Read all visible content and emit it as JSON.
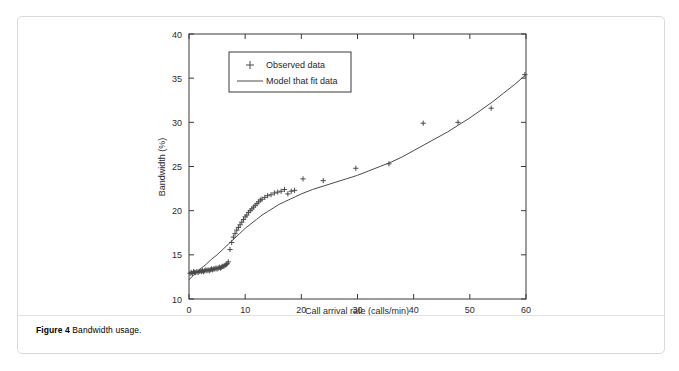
{
  "figure": {
    "caption_label": "Figure 4",
    "caption_text": "Bandwidth usage."
  },
  "chart_data": {
    "type": "scatter",
    "title": "",
    "xlabel": "Call arrival rate (calls/min)",
    "ylabel": "Bandwidth (%)",
    "xlim": [
      0,
      60
    ],
    "ylim": [
      10,
      40
    ],
    "xticks": [
      0,
      10,
      20,
      30,
      40,
      50,
      60
    ],
    "yticks": [
      10,
      15,
      20,
      25,
      30,
      35,
      40
    ],
    "xtick_labels": [
      "0",
      "10",
      "20",
      "30",
      "40",
      "50",
      "60"
    ],
    "ytick_labels": [
      "10",
      "15",
      "20",
      "25",
      "30",
      "35",
      "40"
    ],
    "grid": false,
    "legend_position": "upper left",
    "legend": [
      {
        "label": "Observed data",
        "marker": "plus",
        "color": "#4a4a4a"
      },
      {
        "label": "Model that fit data",
        "marker": "line",
        "color": "#4a4a4a"
      }
    ],
    "series": [
      {
        "name": "Observed data",
        "marker": "plus",
        "color": "#4a4a4a",
        "x": [
          0.2,
          0.4,
          0.6,
          0.8,
          1.0,
          1.2,
          1.4,
          1.6,
          1.8,
          2.0,
          2.2,
          2.4,
          2.6,
          2.8,
          3.0,
          3.2,
          3.4,
          3.6,
          3.8,
          4.0,
          4.2,
          4.4,
          4.6,
          4.8,
          5.0,
          5.2,
          5.4,
          5.6,
          5.8,
          6.0,
          6.2,
          6.4,
          6.6,
          6.8,
          7.0,
          7.3,
          7.6,
          7.9,
          8.2,
          8.5,
          8.8,
          9.1,
          9.4,
          9.7,
          10.0,
          10.3,
          10.6,
          10.9,
          11.2,
          11.5,
          11.8,
          12.1,
          12.4,
          12.7,
          13.0,
          13.5,
          14.0,
          14.6,
          15.2,
          15.8,
          16.4,
          17.0,
          17.6,
          18.2,
          18.8,
          20.3,
          23.9,
          29.7,
          35.6,
          41.7,
          47.9,
          53.8,
          59.8
        ],
        "y": [
          12.9,
          13.0,
          12.9,
          13.1,
          13.0,
          13.0,
          13.1,
          13.0,
          13.1,
          13.2,
          13.1,
          13.2,
          13.1,
          13.2,
          13.3,
          13.2,
          13.3,
          13.2,
          13.3,
          13.4,
          13.3,
          13.4,
          13.4,
          13.5,
          13.4,
          13.5,
          13.6,
          13.5,
          13.6,
          13.7,
          13.7,
          13.8,
          13.9,
          14.0,
          14.2,
          15.6,
          16.4,
          17.0,
          17.4,
          17.8,
          18.1,
          18.4,
          18.7,
          19.0,
          19.3,
          19.5,
          19.8,
          20.0,
          20.2,
          20.4,
          20.6,
          20.8,
          21.0,
          21.2,
          21.3,
          21.5,
          21.7,
          21.8,
          22.0,
          22.1,
          22.2,
          22.4,
          21.9,
          22.2,
          22.3,
          23.6,
          23.4,
          24.8,
          25.3,
          29.9,
          30.0,
          31.6,
          35.4
        ]
      },
      {
        "name": "Model that fit data",
        "marker": "line",
        "color": "#4a4a4a",
        "x": [
          0.0,
          1.0,
          2.0,
          3.0,
          4.0,
          5.0,
          6.0,
          7.0,
          8.0,
          9.0,
          10.0,
          11.0,
          12.0,
          13.0,
          14.0,
          15.0,
          16.0,
          17.0,
          18.0,
          19.0,
          20.0,
          22.0,
          24.0,
          26.0,
          28.0,
          30.0,
          32.0,
          34.0,
          36.0,
          38.0,
          40.0,
          42.0,
          44.0,
          46.0,
          48.0,
          50.0,
          52.0,
          54.0,
          56.0,
          58.0,
          60.0
        ],
        "y": [
          12.2,
          12.8,
          13.4,
          13.9,
          14.5,
          15.0,
          15.6,
          16.2,
          16.8,
          17.4,
          18.0,
          18.5,
          19.0,
          19.5,
          19.9,
          20.3,
          20.7,
          21.0,
          21.3,
          21.6,
          21.9,
          22.4,
          22.8,
          23.2,
          23.6,
          24.0,
          24.5,
          25.0,
          25.5,
          26.1,
          26.8,
          27.5,
          28.2,
          28.9,
          29.7,
          30.5,
          31.4,
          32.3,
          33.3,
          34.3,
          35.4
        ]
      }
    ]
  }
}
